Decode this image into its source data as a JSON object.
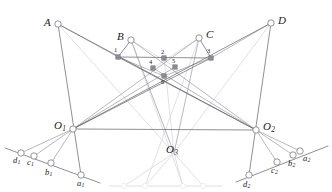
{
  "figure": {
    "background_color": "#ffffff",
    "width": 332,
    "height": 192,
    "stroke_colors": {
      "dark_line": "#6b6b72",
      "mid_line": "#9a9aa2",
      "faint_line": "#d8d8dc",
      "very_faint_line": "#eaeaee",
      "node_stroke": "#7a7a82",
      "node_fill": "#ffffff",
      "square_fill": "#8c8c94",
      "label_color": "#1b1b1b"
    }
  },
  "labels": {
    "A": "A",
    "B": "B",
    "C": "C",
    "D": "D",
    "O1": "O",
    "O1_sub": "1",
    "O2": "O",
    "O2_sub": "2",
    "O3": "O",
    "O3_sub": "3",
    "a1": "a",
    "a1_sub": "1",
    "b1": "b",
    "b1_sub": "1",
    "c1": "c",
    "c1_sub": "1",
    "d1": "d",
    "d1_sub": "1",
    "a2": "a",
    "a2_sub": "2",
    "b2": "b",
    "b2_sub": "2",
    "c2": "c",
    "c2_sub": "2",
    "d2": "d",
    "d2_sub": "2",
    "n1": "1",
    "n2": "2",
    "n3": "3",
    "n4": "4",
    "n5": "5",
    "n6": "6"
  },
  "points": {
    "A": {
      "x": 58,
      "y": 24,
      "type": "circle"
    },
    "B": {
      "x": 131,
      "y": 40,
      "type": "circle"
    },
    "C": {
      "x": 199,
      "y": 38,
      "type": "circle"
    },
    "D": {
      "x": 271,
      "y": 23,
      "type": "circle"
    },
    "O1": {
      "x": 73,
      "y": 129,
      "type": "circle"
    },
    "O2": {
      "x": 256,
      "y": 130,
      "type": "circle"
    },
    "O3": {
      "x": 174,
      "y": 153,
      "type": "vertex"
    },
    "p1": {
      "x": 118,
      "y": 57,
      "type": "square"
    },
    "p2": {
      "x": 164,
      "y": 58,
      "type": "square"
    },
    "p3": {
      "x": 211,
      "y": 58,
      "type": "square"
    },
    "p4": {
      "x": 153,
      "y": 68,
      "type": "square"
    },
    "p5": {
      "x": 175,
      "y": 67,
      "type": "square"
    },
    "p6": {
      "x": 164,
      "y": 76,
      "type": "square"
    },
    "a1": {
      "x": 81,
      "y": 175,
      "type": "circle"
    },
    "b1": {
      "x": 51,
      "y": 163,
      "type": "circle"
    },
    "c1": {
      "x": 34,
      "y": 156,
      "type": "circle"
    },
    "d1": {
      "x": 21,
      "y": 153,
      "type": "circle"
    },
    "a2": {
      "x": 300,
      "y": 151,
      "type": "circle"
    },
    "b2": {
      "x": 293,
      "y": 155,
      "type": "circle"
    },
    "c2": {
      "x": 277,
      "y": 162,
      "type": "circle"
    },
    "d2": {
      "x": 249,
      "y": 175,
      "type": "circle"
    },
    "f1": {
      "x": 124,
      "y": 186,
      "type": "faint-circle"
    },
    "f2": {
      "x": 145,
      "y": 186,
      "type": "faint-circle"
    },
    "f3": {
      "x": 183,
      "y": 186,
      "type": "faint-circle"
    },
    "f4": {
      "x": 203,
      "y": 186,
      "type": "faint-circle"
    }
  },
  "label_positions": {
    "A": {
      "x": 44,
      "y": 17
    },
    "B": {
      "x": 117,
      "y": 31
    },
    "C": {
      "x": 206,
      "y": 29
    },
    "D": {
      "x": 278,
      "y": 15
    },
    "O1": {
      "x": 54,
      "y": 120
    },
    "O2": {
      "x": 263,
      "y": 121
    },
    "O3": {
      "x": 166,
      "y": 144
    },
    "a1": {
      "x": 77,
      "y": 179
    },
    "b1": {
      "x": 45,
      "y": 168
    },
    "c1": {
      "x": 27,
      "y": 158
    },
    "d1": {
      "x": 13,
      "y": 156
    },
    "a2": {
      "x": 303,
      "y": 154
    },
    "b2": {
      "x": 288,
      "y": 159
    },
    "c2": {
      "x": 271,
      "y": 166
    },
    "d2": {
      "x": 243,
      "y": 180
    },
    "n1": {
      "x": 114,
      "y": 47
    },
    "n2": {
      "x": 161,
      "y": 49
    },
    "n3": {
      "x": 207,
      "y": 48
    },
    "n4": {
      "x": 149,
      "y": 59
    },
    "n5": {
      "x": 172,
      "y": 58
    },
    "n6": {
      "x": 161,
      "y": 79
    }
  },
  "segments": {
    "dark": [
      {
        "name": "O1-to-D",
        "x1": 73,
        "y1": 129,
        "x2": 271,
        "y2": 23
      },
      {
        "name": "O2-to-A",
        "x1": 256,
        "y1": 130,
        "x2": 58,
        "y2": 24
      },
      {
        "name": "O1-to-p3",
        "x1": 73,
        "y1": 129,
        "x2": 211,
        "y2": 58
      },
      {
        "name": "O2-to-p1",
        "x1": 256,
        "y1": 130,
        "x2": 118,
        "y2": 57
      },
      {
        "name": "O1-to-O2",
        "x1": 73,
        "y1": 129,
        "x2": 256,
        "y2": 130
      },
      {
        "name": "p1-to-p3",
        "x1": 118,
        "y1": 57,
        "x2": 211,
        "y2": 58
      },
      {
        "name": "B-to-p1",
        "x1": 131,
        "y1": 40,
        "x2": 118,
        "y2": 57
      },
      {
        "name": "C-to-p3",
        "x1": 199,
        "y1": 38,
        "x2": 211,
        "y2": 58
      },
      {
        "name": "A-to-a1",
        "x1": 58,
        "y1": 24,
        "x2": 81,
        "y2": 175
      },
      {
        "name": "D-to-d2",
        "x1": 271,
        "y1": 23,
        "x2": 249,
        "y2": 175
      },
      {
        "name": "O1-axis",
        "x1": 5,
        "y1": 148,
        "x2": 100,
        "y2": 183
      },
      {
        "name": "O2-axis",
        "x1": 236,
        "y1": 182,
        "x2": 328,
        "y2": 146
      }
    ],
    "mid": [
      {
        "name": "A-to-p1",
        "x1": 58,
        "y1": 24,
        "x2": 118,
        "y2": 57
      },
      {
        "name": "D-to-p3",
        "x1": 271,
        "y1": 23,
        "x2": 211,
        "y2": 58
      },
      {
        "name": "B-to-O3",
        "x1": 131,
        "y1": 40,
        "x2": 174,
        "y2": 153
      },
      {
        "name": "C-to-O3",
        "x1": 199,
        "y1": 38,
        "x2": 174,
        "y2": 153
      },
      {
        "name": "O1-to-p5",
        "x1": 73,
        "y1": 129,
        "x2": 175,
        "y2": 67
      },
      {
        "name": "O2-to-p4",
        "x1": 256,
        "y1": 130,
        "x2": 153,
        "y2": 68
      },
      {
        "name": "O1-to-C",
        "x1": 73,
        "y1": 129,
        "x2": 199,
        "y2": 38
      },
      {
        "name": "O2-to-B",
        "x1": 256,
        "y1": 130,
        "x2": 131,
        "y2": 40
      },
      {
        "name": "O1-to-b1",
        "x1": 73,
        "y1": 129,
        "x2": 51,
        "y2": 163
      },
      {
        "name": "O1-to-c1",
        "x1": 73,
        "y1": 129,
        "x2": 34,
        "y2": 156
      },
      {
        "name": "O1-to-d1",
        "x1": 73,
        "y1": 129,
        "x2": 21,
        "y2": 153
      },
      {
        "name": "O2-to-b2",
        "x1": 256,
        "y1": 130,
        "x2": 293,
        "y2": 155
      },
      {
        "name": "O2-to-c2",
        "x1": 256,
        "y1": 130,
        "x2": 277,
        "y2": 162
      },
      {
        "name": "O2-to-a2",
        "x1": 256,
        "y1": 130,
        "x2": 300,
        "y2": 151
      },
      {
        "name": "p1-to-p6",
        "x1": 118,
        "y1": 57,
        "x2": 164,
        "y2": 76
      },
      {
        "name": "p3-to-p6",
        "x1": 211,
        "y1": 58,
        "x2": 164,
        "y2": 76
      }
    ],
    "faint": [
      {
        "name": "B-to-p5",
        "x1": 131,
        "y1": 40,
        "x2": 175,
        "y2": 67
      },
      {
        "name": "C-to-p4",
        "x1": 199,
        "y1": 38,
        "x2": 153,
        "y2": 68
      },
      {
        "name": "A-to-O3",
        "x1": 58,
        "y1": 24,
        "x2": 174,
        "y2": 153
      },
      {
        "name": "D-to-O3",
        "x1": 271,
        "y1": 23,
        "x2": 174,
        "y2": 153
      },
      {
        "name": "O3-to-f1",
        "x1": 174,
        "y1": 153,
        "x2": 124,
        "y2": 186
      },
      {
        "name": "O3-to-f2",
        "x1": 174,
        "y1": 153,
        "x2": 145,
        "y2": 186
      },
      {
        "name": "O3-to-f3",
        "x1": 174,
        "y1": 153,
        "x2": 183,
        "y2": 186
      },
      {
        "name": "O3-to-f4",
        "x1": 174,
        "y1": 153,
        "x2": 203,
        "y2": 186
      },
      {
        "name": "bottom-axis",
        "x1": 110,
        "y1": 186,
        "x2": 222,
        "y2": 186
      },
      {
        "name": "B-to-f3",
        "x1": 131,
        "y1": 40,
        "x2": 183,
        "y2": 186
      },
      {
        "name": "C-to-f2",
        "x1": 199,
        "y1": 38,
        "x2": 145,
        "y2": 186
      },
      {
        "name": "p2-to-O3",
        "x1": 164,
        "y1": 58,
        "x2": 174,
        "y2": 153
      }
    ]
  }
}
